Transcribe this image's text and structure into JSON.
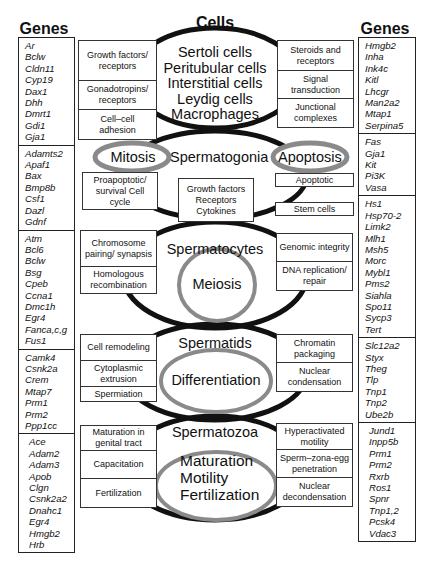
{
  "titles": {
    "genes_left": "Genes",
    "cells": "Cells",
    "genes_right": "Genes"
  },
  "genes_left": [
    [
      "Ar",
      "Bclw",
      "Cldn11",
      "Cyp19",
      "Dax1",
      "Dhh",
      "Dmrt1",
      "Gdi1",
      "Gja1"
    ],
    [
      "Adamts2",
      "Apaf1",
      "Bax",
      "Bmp8b",
      "Csf1",
      "Dazl",
      "Gdnf"
    ],
    [
      "Atm",
      "Bcl6",
      "Bclw",
      "Bsg",
      "Cpeb",
      "Ccna1",
      "Dmc1h",
      "Egr4",
      "Fanca,c,g",
      "Fus1"
    ],
    [
      "Camk4",
      "Csnk2a",
      "Crem",
      "Mtap7",
      "Prm1",
      "Prm2",
      "Ppp1cc"
    ],
    [
      "Ace",
      "Adam2",
      "Adam3",
      "Apob",
      "Clgn",
      "Csnk2a2",
      "Dnahc1",
      "Egr4",
      "Hmgb2",
      "Hrb"
    ]
  ],
  "genes_right": [
    [
      "Hmgb2",
      "Inha",
      "Ink4c",
      "Kitl",
      "Lhcgr",
      "Man2a2",
      "Mtap1",
      "Serpina5"
    ],
    [
      "Fas",
      "Gja1",
      "Kit",
      "Pi3K",
      "Vasa"
    ],
    [
      "Hs1",
      "Hsp70-2",
      "Limk2",
      "Mlh1",
      "Msh5",
      "Morc",
      "Mybl1",
      "Pms2",
      "Siahla",
      "Spo11",
      "Sycp3",
      "Tert"
    ],
    [
      "Slc12a2",
      "Styx",
      "Theg",
      "Tlp",
      "Tnp1",
      "Tnp2",
      "Ube2b"
    ],
    [
      "Jund1",
      "Inpp5b",
      "Prm1",
      "Prm2",
      "Rxrb",
      "Ros1",
      "Spnr",
      "Tnp1,2",
      "Pcsk4",
      "Vdac3"
    ]
  ],
  "stages": {
    "somatic": [
      "Sertoli cells",
      "Peritubular cells",
      "Interstitial cells",
      "Leydig cells",
      "Macrophages"
    ],
    "spermatogonia": "Spermatogonia",
    "mitosis": "Mitosis",
    "apoptosis": "Apoptosis",
    "spermatocytes": "Spermatocytes",
    "meiosis": "Meiosis",
    "spermatids": "Spermatids",
    "differentiation": "Differentiation",
    "spermatozoa": "Spermatozoa",
    "spermatozoa_processes": [
      "Maturation",
      "Motility",
      "Fertilization"
    ]
  },
  "boxes": {
    "somatic_left": [
      "Growth factors/ receptors",
      "Gonadotropins/ receptors",
      "Cell–cell adhesion"
    ],
    "somatic_right": [
      "Steroids and receptors",
      "Signal transduction",
      "Junctional complexes"
    ],
    "spg_left": "Proapoptotic/ survival Cell cycle",
    "spg_center": "Growth factors Receptors Cytokines",
    "spg_right_apoptotic": "Apoptotic",
    "spg_right_stem": "Stem cells",
    "spc_left": [
      "Chromosome pairing/ synapsis",
      "Homologous recombination"
    ],
    "spc_right": [
      "Genomic integrity",
      "DNA replication/ repair"
    ],
    "spt_left": [
      "Cell remodeling",
      "Cytoplasmic extrusion",
      "Spermiation"
    ],
    "spt_right": [
      "Chromatin packaging",
      "Nuclear condensation"
    ],
    "spz_left": [
      "Maturation in genital tract",
      "Capacitation",
      "Fertilization"
    ],
    "spz_right": [
      "Hyperactivated motility",
      "Sperm–zona-egg penetration",
      "Nuclear decondensation"
    ]
  },
  "colors": {
    "outline": "#111111",
    "ring_gray": "#8a8a8a",
    "box_border": "#333333"
  }
}
